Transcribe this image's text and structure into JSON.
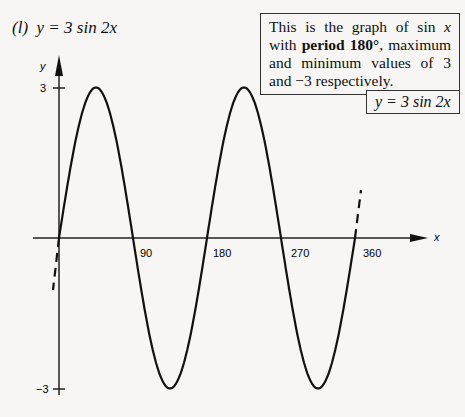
{
  "header": {
    "part_label": "(l)",
    "equation": "y = 3 sin 2x"
  },
  "note": {
    "text_before": "This is the graph of sin ",
    "var": "x",
    "text_mid": " with ",
    "bold": "period 180°",
    "text_after": ", maximum and minimum values of 3 and −3 respectively."
  },
  "equation_box": "y = 3 sin 2x",
  "axes": {
    "x_label": "x",
    "y_label": "y",
    "x_ticks": [
      "90",
      "180",
      "270",
      "360"
    ],
    "y_ticks": [
      "3",
      "−3"
    ]
  },
  "chart_data": {
    "type": "line",
    "title": "y = 3 sin 2x",
    "xlabel": "x",
    "ylabel": "y",
    "xlim": [
      0,
      360
    ],
    "ylim": [
      -3,
      3
    ],
    "x_ticks": [
      90,
      180,
      270,
      360
    ],
    "y_ticks": [
      3,
      -3
    ],
    "grid": false,
    "series": [
      {
        "name": "y = 3 sin 2x",
        "x": [
          0,
          45,
          90,
          135,
          180,
          225,
          270,
          315,
          360
        ],
        "values": [
          0,
          3,
          0,
          -3,
          0,
          3,
          0,
          -3,
          0
        ]
      }
    ],
    "annotations": [
      "Dashed extensions of curve beyond x = 0 and x = 360",
      "Period 180°, maximum 3, minimum −3"
    ]
  }
}
